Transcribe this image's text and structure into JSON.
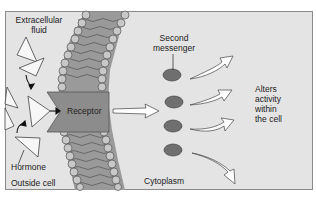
{
  "diagram": {
    "labels": {
      "extracellular_line1": "Extracellular",
      "extracellular_line2": "fluid",
      "hormone": "Hormone",
      "outside_cell": "Outside cell",
      "receptor": "Receptor",
      "second_messenger_line1": "Second",
      "second_messenger_line2": "messenger",
      "cytoplasm": "Cytoplasm",
      "alters_line1": "Alters",
      "alters_line2": "activity",
      "alters_line3": "within",
      "alters_line4": "the cell"
    },
    "colors": {
      "background": "#e4e4e4",
      "border": "#8a8a8a",
      "receptor": "#8c8c8c",
      "membrane_core": "#9a9a9a",
      "phospholipid_head": "#c8c8c8",
      "second_messenger": "#6f6f6f",
      "arrow_fill": "#ffffff"
    }
  }
}
